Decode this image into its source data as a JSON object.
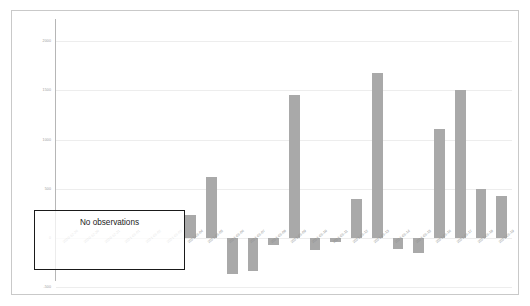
{
  "chart_data": {
    "type": "bar",
    "title": "",
    "xlabel": "",
    "ylabel": "",
    "ylim": [
      -500,
      2000
    ],
    "grid": true,
    "legend": "none",
    "bar_color": "#a9a9a9",
    "yticks": [
      2000,
      1500,
      1000,
      500,
      0,
      -500
    ],
    "ytick_labels": [
      "2000",
      "1500",
      "1000",
      "500",
      "0",
      "-500"
    ],
    "categories": [
      "2020-12-26",
      "2020-12-30",
      "2020-12-31",
      "2021-01-01",
      "2021-01-02",
      "2021-01-03",
      "2021-01-04",
      "2021-01-05",
      "2021-01-06",
      "2021-01-07",
      "2021-01-08",
      "2021-01-09",
      "2021-01-10",
      "2021-01-11",
      "2021-01-12",
      "2021-01-13",
      "2021-01-14",
      "2021-01-15",
      "2021-01-16",
      "2021-01-17",
      "2021-01-18",
      "2021-01-19"
    ],
    "values": [
      0,
      0,
      0,
      0,
      0,
      0,
      230,
      620,
      -360,
      -330,
      -75,
      1450,
      -120,
      -45,
      400,
      1680,
      -110,
      -150,
      1110,
      1500,
      500,
      430
    ],
    "annotations": [
      {
        "text": "No observations",
        "covers_categories": [
          "2020-12-26",
          "2020-12-30",
          "2020-12-31",
          "2021-01-01",
          "2021-01-02",
          "2021-01-03"
        ]
      }
    ]
  },
  "annotation": {
    "no_observations_label": "No observations"
  }
}
